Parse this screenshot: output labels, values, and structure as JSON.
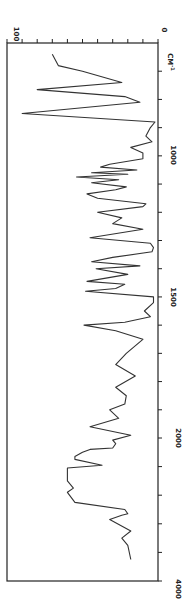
{
  "chart_data": {
    "type": "line",
    "title": "",
    "orientation": "rotated-90-clockwise",
    "xlabel": "CM-1",
    "ylabel": "Transmittance (%)",
    "x_axis": {
      "label": "CM-1",
      "tick_labels": [
        "1000",
        "1500",
        "2000",
        "4000"
      ],
      "range": [
        600,
        4000
      ],
      "scale_change_at": 2000,
      "major_ticks": [
        700,
        800,
        900,
        1000,
        1100,
        1200,
        1300,
        1400,
        1500,
        1600,
        1700,
        1800,
        1900,
        2000,
        2400,
        2800,
        3200,
        3600,
        4000
      ]
    },
    "y_axis": {
      "label": "",
      "tick_labels": [
        "100",
        "0"
      ],
      "range": [
        100,
        0
      ],
      "ticks": [
        100,
        90,
        80,
        70,
        60,
        50,
        40,
        30,
        20,
        10,
        0
      ]
    },
    "grid": false,
    "legend": null,
    "series": [
      {
        "name": "IR spectrum",
        "x": [
          640,
          680,
          700,
          740,
          765,
          790,
          810,
          850,
          880,
          900,
          930,
          950,
          970,
          990,
          1010,
          1030,
          1040,
          1050,
          1060,
          1065,
          1075,
          1085,
          1095,
          1110,
          1120,
          1135,
          1150,
          1170,
          1180,
          1200,
          1220,
          1240,
          1260,
          1290,
          1310,
          1325,
          1340,
          1360,
          1375,
          1390,
          1400,
          1420,
          1445,
          1455,
          1470,
          1480,
          1500,
          1520,
          1550,
          1570,
          1590,
          1600,
          1620,
          1650,
          1700,
          1740,
          1780,
          1820,
          1850,
          1880,
          1900,
          1930,
          1960,
          1990,
          2030,
          2080,
          2140,
          2160,
          2200,
          2260,
          2300,
          2380,
          2420,
          2600,
          2700,
          2760,
          2900,
          3000,
          3060,
          3080,
          3140,
          3300,
          3400,
          3500,
          3700
        ],
        "values": [
          70,
          66,
          50,
          24,
          80,
          22,
          12,
          90,
          2,
          5,
          8,
          4,
          18,
          10,
          10,
          32,
          38,
          14,
          44,
          20,
          54,
          26,
          44,
          21,
          28,
          47,
          40,
          8,
          10,
          40,
          24,
          30,
          10,
          45,
          5,
          3,
          4,
          30,
          44,
          12,
          41,
          20,
          47,
          22,
          28,
          48,
          3,
          3,
          9,
          5,
          22,
          49,
          28,
          10,
          21,
          28,
          15,
          28,
          21,
          22,
          32,
          26,
          45,
          18,
          30,
          28,
          30,
          45,
          50,
          55,
          55,
          37,
          60,
          60,
          56,
          60,
          55,
          22,
          20,
          24,
          32,
          18,
          24,
          20,
          18
        ]
      }
    ]
  },
  "labels": {
    "y_max": "100",
    "y_min": "0",
    "x_unit": "CM",
    "x_unit_sup": "-1",
    "x_1000": "1000",
    "x_1500": "1500",
    "x_2000": "2000",
    "x_4000": "4000"
  }
}
